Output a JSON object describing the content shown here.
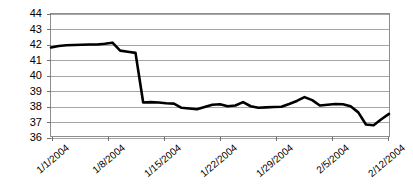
{
  "chart_data": {
    "type": "line",
    "title": "",
    "xlabel": "",
    "ylabel": "",
    "ylim": [
      36,
      44
    ],
    "yticks": [
      36,
      37,
      38,
      39,
      40,
      41,
      42,
      43,
      44
    ],
    "ytick_labels": [
      "36",
      "37",
      "38",
      "39",
      "40",
      "41",
      "42",
      "43",
      "44"
    ],
    "grid": "horizontal",
    "legend": "none",
    "line_color": "#000000",
    "line_width": 2.6,
    "gridline_color": "#a6a6a6",
    "background": "#ffffff",
    "xtick_labels": [
      "1/1/2004",
      "1/8/2004",
      "1/15/2004",
      "1/22/2004",
      "1/29/2004",
      "2/5/2004",
      "2/12/2004"
    ],
    "xtick_label_rotation": -40,
    "x": [
      "1/1/2004",
      "1/2/2004",
      "1/3/2004",
      "1/4/2004",
      "1/5/2004",
      "1/6/2004",
      "1/7/2004",
      "1/8/2004",
      "1/9/2004",
      "1/10/2004",
      "1/11/2004",
      "1/12/2004",
      "1/13/2004",
      "1/14/2004",
      "1/15/2004",
      "1/16/2004",
      "1/17/2004",
      "1/18/2004",
      "1/19/2004",
      "1/20/2004",
      "1/21/2004",
      "1/22/2004",
      "1/23/2004",
      "1/24/2004",
      "1/25/2004",
      "1/26/2004",
      "1/27/2004",
      "1/28/2004",
      "1/29/2004",
      "1/30/2004",
      "1/31/2004",
      "2/1/2004",
      "2/2/2004",
      "2/3/2004",
      "2/4/2004",
      "2/5/2004",
      "2/6/2004",
      "2/7/2004",
      "2/8/2004",
      "2/9/2004",
      "2/10/2004",
      "2/11/2004",
      "2/12/2004",
      "2/13/2004",
      "2/14/2004"
    ],
    "values": [
      41.8,
      41.9,
      41.95,
      41.97,
      41.98,
      42.0,
      42.0,
      42.05,
      42.12,
      41.6,
      41.52,
      41.45,
      38.2,
      38.22,
      38.2,
      38.15,
      38.12,
      37.85,
      37.8,
      37.75,
      37.9,
      38.05,
      38.08,
      37.95,
      38.0,
      38.22,
      37.95,
      37.85,
      37.88,
      37.9,
      37.92,
      38.1,
      38.3,
      38.55,
      38.35,
      38.0,
      38.05,
      38.1,
      38.08,
      37.95,
      37.55,
      36.75,
      36.7,
      37.1,
      37.45
    ],
    "series": [
      {
        "name": "price",
        "values": [
          41.8,
          41.9,
          41.95,
          41.97,
          41.98,
          42.0,
          42.0,
          42.05,
          42.12,
          41.6,
          41.52,
          41.45,
          38.2,
          38.22,
          38.2,
          38.15,
          38.12,
          37.85,
          37.8,
          37.75,
          37.9,
          38.05,
          38.08,
          37.95,
          38.0,
          38.22,
          37.95,
          37.85,
          37.88,
          37.9,
          37.92,
          38.1,
          38.3,
          38.55,
          38.35,
          38.0,
          38.05,
          38.1,
          38.08,
          37.95,
          37.55,
          36.75,
          36.7,
          37.1,
          37.45
        ]
      }
    ],
    "max_value": 42.12,
    "min_value": 36.7,
    "start_value": 41.8,
    "end_value": 37.45
  }
}
